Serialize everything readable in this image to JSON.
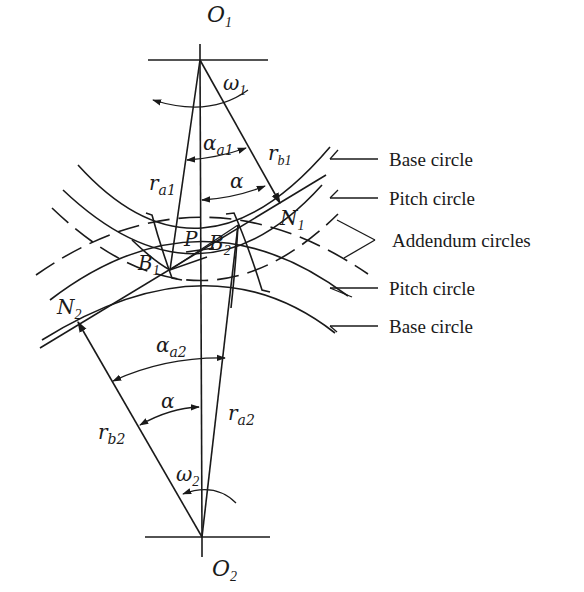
{
  "diagram": {
    "type": "gear-meshing-geometry",
    "points": {
      "O1": {
        "main": "O",
        "sub": "1"
      },
      "O2": {
        "main": "O",
        "sub": "2"
      },
      "P": {
        "main": "P",
        "sub": ""
      },
      "N1": {
        "main": "N",
        "sub": "1"
      },
      "N2": {
        "main": "N",
        "sub": "2"
      },
      "B1": {
        "main": "B",
        "sub": "1"
      },
      "B2": {
        "main": "B",
        "sub": "2"
      }
    },
    "symbols": {
      "omega1": {
        "main": "ω",
        "sub": "1"
      },
      "omega2": {
        "main": "ω",
        "sub": "2"
      },
      "alpha_a1": {
        "main": "α",
        "sub": "a1"
      },
      "alpha_a2": {
        "main": "α",
        "sub": "a2"
      },
      "alpha_top": {
        "main": "α",
        "sub": ""
      },
      "alpha_bottom": {
        "main": "α",
        "sub": ""
      },
      "r_a1": {
        "main": "r",
        "sub": "a1"
      },
      "r_b1": {
        "main": "r",
        "sub": "b1"
      },
      "r_a2": {
        "main": "r",
        "sub": "a2"
      },
      "r_b2": {
        "main": "r",
        "sub": "b2"
      }
    },
    "callouts": [
      {
        "id": "base-circle-1",
        "label": "Base circle"
      },
      {
        "id": "pitch-circle-1",
        "label": "Pitch circle"
      },
      {
        "id": "addendum-circles",
        "label": "Addendum circles"
      },
      {
        "id": "pitch-circle-2",
        "label": "Pitch circle"
      },
      {
        "id": "base-circle-2",
        "label": "Base circle"
      }
    ],
    "colors": {
      "ink": "#1a1a1a",
      "background": "#ffffff"
    }
  }
}
